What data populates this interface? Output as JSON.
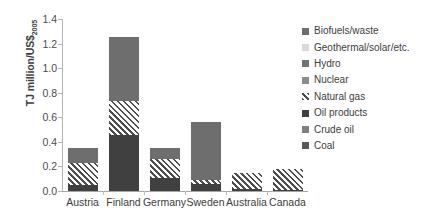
{
  "chart_data": {
    "type": "bar",
    "stacked": true,
    "title": "",
    "xlabel": "",
    "ylabel": "TJ million/US$2005",
    "ylabel_main": "TJ million/US$",
    "ylabel_sub": "2005",
    "ylim": [
      0.0,
      1.4
    ],
    "ytick_step": 0.2,
    "yticks": [
      "1.4",
      "1.2",
      "1.0",
      "0.8",
      "0.6",
      "0.4",
      "0.2",
      "0.0"
    ],
    "ytick_values": [
      1.4,
      1.2,
      1.0,
      0.8,
      0.6,
      0.4,
      0.2,
      0.0
    ],
    "grid": false,
    "legend_position": "right",
    "categories": [
      "Austria",
      "Finland",
      "Germany",
      "Sweden",
      "Australia",
      "Canada"
    ],
    "series": [
      {
        "name": "Coal",
        "key": "coal",
        "color": "#595959",
        "pattern": "solid",
        "values": [
          0.0,
          0.0,
          0.0,
          0.0,
          0.0,
          0.0
        ]
      },
      {
        "name": "Crude oil",
        "key": "crude",
        "color": "#7f7f7f",
        "pattern": "solid",
        "values": [
          0.0,
          0.0,
          0.0,
          0.0,
          0.0,
          0.0
        ]
      },
      {
        "name": "Oil products",
        "key": "oil",
        "color": "#404040",
        "pattern": "solid",
        "values": [
          0.05,
          0.46,
          0.11,
          0.06,
          0.02,
          0.01
        ]
      },
      {
        "name": "Natural gas",
        "key": "gas",
        "color": "#4d4d4d",
        "pattern": "diagonal-hatch",
        "values": [
          0.18,
          0.27,
          0.15,
          0.03,
          0.13,
          0.17
        ]
      },
      {
        "name": "Nuclear",
        "key": "nuclear",
        "color": "#8c8c8c",
        "pattern": "solid",
        "values": [
          0.0,
          0.0,
          0.0,
          0.0,
          0.0,
          0.0
        ]
      },
      {
        "name": "Hydro",
        "key": "hydro",
        "color": "#737373",
        "pattern": "solid",
        "values": [
          0.0,
          0.0,
          0.0,
          0.0,
          0.0,
          0.0
        ]
      },
      {
        "name": "Geothermal/solar/etc.",
        "key": "geo",
        "color": "#d9d9d9",
        "pattern": "solid",
        "values": [
          0.0,
          0.0,
          0.0,
          0.0,
          0.0,
          0.0
        ]
      },
      {
        "name": "Biofuels/waste",
        "key": "bio",
        "color": "#6e6e6e",
        "pattern": "solid",
        "values": [
          0.12,
          0.52,
          0.09,
          0.47,
          0.0,
          0.0
        ]
      }
    ],
    "totals": [
      0.35,
      1.25,
      0.35,
      0.56,
      0.15,
      0.18
    ]
  },
  "legend": {
    "items": [
      {
        "label": "Biofuels/waste",
        "swatch": "legend-swatch-biofuels"
      },
      {
        "label": "Geothermal/solar/etc.",
        "swatch": "legend-swatch-geothermal"
      },
      {
        "label": "Hydro",
        "swatch": "legend-swatch-hydro"
      },
      {
        "label": "Nuclear",
        "swatch": "legend-swatch-nuclear"
      },
      {
        "label": "Natural gas",
        "swatch": "legend-swatch-natural-gas"
      },
      {
        "label": "Oil products",
        "swatch": "legend-swatch-oil-products"
      },
      {
        "label": "Crude oil",
        "swatch": "legend-swatch-crude-oil"
      },
      {
        "label": "Coal",
        "swatch": "legend-swatch-coal"
      }
    ]
  }
}
